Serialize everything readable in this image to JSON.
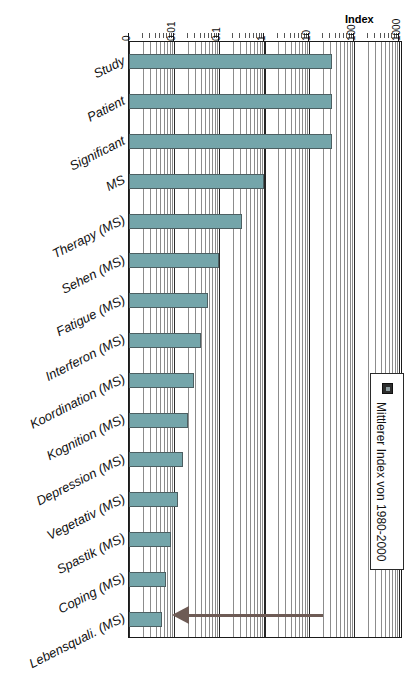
{
  "chart_data": {
    "type": "bar",
    "orientation": "horizontal",
    "title": "",
    "xlabel": "Index",
    "ylabel": "",
    "xscale": "log",
    "xlim": [
      0.001,
      1000
    ],
    "grid": true,
    "legend_position": "right",
    "tick_labels": [
      "0",
      "0.01",
      "0.1",
      "1",
      "10",
      "100",
      "1000"
    ],
    "tick_values": [
      0.001,
      0.01,
      0.1,
      1,
      10,
      100,
      1000
    ],
    "categories": [
      "Study",
      "Patient",
      "Significant",
      "MS",
      "Therapy (MS)",
      "Sehen (MS)",
      "Fatigue (MS)",
      "Interferon (MS)",
      "Koordination (MS)",
      "Kognition (MS)",
      "Depression (MS)",
      "Vegetativ (MS)",
      "Spastik (MS)",
      "Coping (MS)",
      "Lebensquali. (MS)"
    ],
    "series": [
      {
        "name": "Mittlerer Index von 1980-2000",
        "color": "#74a5aa",
        "values": [
          32,
          32,
          32,
          1.0,
          0.32,
          0.1,
          0.056,
          0.04,
          0.028,
          0.02,
          0.016,
          0.0125,
          0.0085,
          0.0068,
          0.0055
        ]
      }
    ],
    "annotations": [
      {
        "type": "arrow",
        "label": "",
        "direction": "left",
        "color": "#6e5b55"
      }
    ]
  },
  "axis": {
    "index_title": "Index"
  },
  "legend": {
    "marker": "square-marker",
    "label": "Mittlerer Index von 1980-2000"
  }
}
